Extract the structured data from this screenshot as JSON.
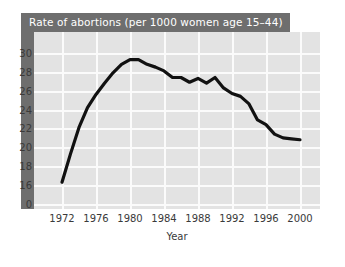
{
  "chart_data": {
    "type": "line",
    "title": "Rate of abortions (per 1000 women age 15–44)",
    "xlabel": "Year",
    "ylabel": "",
    "xlim": [
      1972,
      2001
    ],
    "ylim": [
      15,
      31
    ],
    "grid": true,
    "legend": "none",
    "y_ticks": [
      30,
      28,
      26,
      24,
      22,
      20,
      18,
      16,
      0
    ],
    "x_ticks": [
      1972,
      1976,
      1980,
      1984,
      1988,
      1992,
      1996,
      2000
    ],
    "axis_break": "y-axis is broken between 0 and 16",
    "line_color": "#111111",
    "plot_background": "#e3e3e3",
    "gridline_color": "#fbfbfb",
    "title_bar_color": "#6e6e6e",
    "title_text_color": "#ffffff",
    "series": [
      {
        "name": "Rate of abortions",
        "x": [
          1972,
          1973,
          1974,
          1975,
          1976,
          1977,
          1978,
          1979,
          1980,
          1981,
          1982,
          1983,
          1984,
          1985,
          1986,
          1987,
          1988,
          1989,
          1990,
          1991,
          1992,
          1993,
          1994,
          1995,
          1996,
          1997,
          1998,
          1999,
          2000
        ],
        "values": [
          16.3,
          19.3,
          22.1,
          24.2,
          25.6,
          26.8,
          27.9,
          28.8,
          29.3,
          29.3,
          28.8,
          28.5,
          28.1,
          27.4,
          27.4,
          26.9,
          27.3,
          26.8,
          27.4,
          26.3,
          25.7,
          25.4,
          24.6,
          22.9,
          22.4,
          21.4,
          21.0,
          20.9,
          20.8
        ]
      }
    ]
  }
}
